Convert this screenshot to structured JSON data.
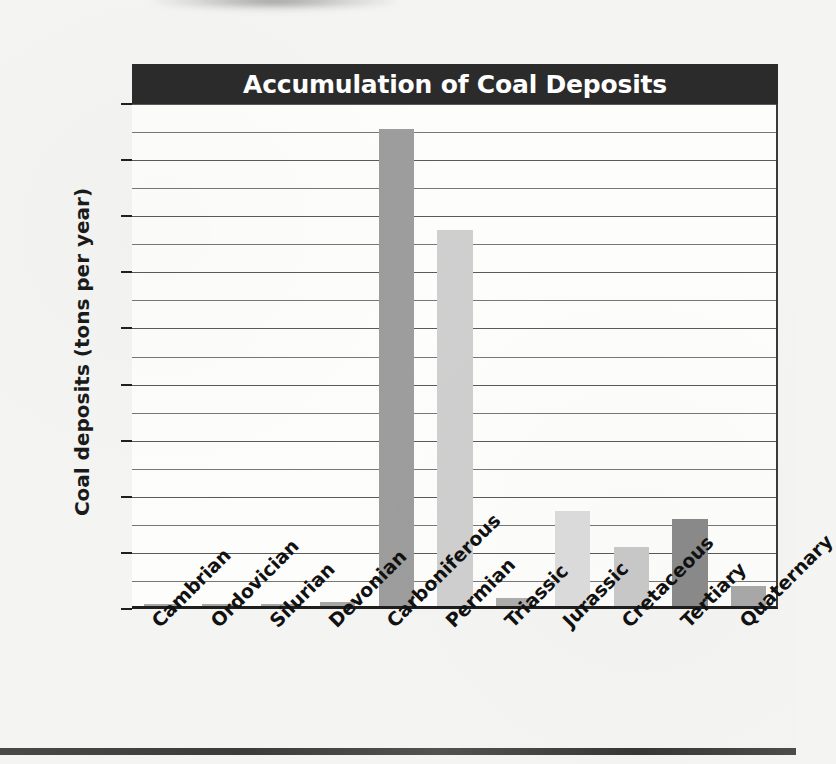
{
  "chart_data": {
    "type": "bar",
    "title": "Accumulation of Coal Deposits",
    "xlabel": "",
    "ylabel": "Coal deposits (tons per year)",
    "ylim": [
      0,
      90
    ],
    "ytick_labels": [
      "0",
      "10",
      "20",
      "30",
      "40",
      "50",
      "60",
      "70",
      "80",
      "90"
    ],
    "ytick_values": [
      0,
      10,
      20,
      30,
      40,
      50,
      60,
      70,
      80,
      90
    ],
    "grid": "horizontal gridlines every 5 units",
    "gridline_interval": 5,
    "legend": "none",
    "categories": [
      "Cambrian",
      "Ordovician",
      "Silurian",
      "Devonian",
      "Carboniferous",
      "Permian",
      "Triassic",
      "Jurassic",
      "Cretaceous",
      "Tertiary",
      "Quaternary"
    ],
    "values": [
      0.2,
      0.2,
      0.3,
      0.7,
      85,
      67,
      1.5,
      17,
      10.5,
      15.5,
      3.5
    ],
    "bar_colors": [
      "#a6a6a6",
      "#a6a6a6",
      "#a6a6a6",
      "#a6a6a6",
      "#9d9d9d",
      "#cfcfcf",
      "#adadad",
      "#dcdcdc",
      "#c9c9c9",
      "#8a8a8a",
      "#a8a8a8"
    ]
  },
  "style": {
    "title_bar_color": "#2b2b2b",
    "title_text_color": "#ffffff",
    "plot_background": "#fdfdfc",
    "gridline_color": "#777777",
    "axis_color": "#1f1f1f",
    "page_background": "#f4f4f2"
  }
}
